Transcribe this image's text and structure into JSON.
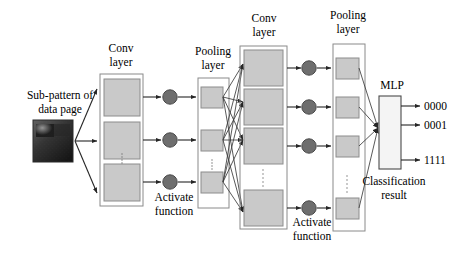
{
  "figure": {
    "kind": "cnn-architecture-diagram",
    "background": "#ffffff"
  },
  "labels": {
    "input_line1": "Sub-pattern of",
    "input_line2": "data page",
    "conv1_line1": "Conv",
    "conv1_line2": "layer",
    "pool1_line1": "Pooling",
    "pool1_line2": "layer",
    "conv2_line1": "Conv",
    "conv2_line2": "layer",
    "pool2_line1": "Pooling",
    "pool2_line2": "layer",
    "activate1_line1": "Activate",
    "activate1_line2": "function",
    "activate2_line1": "Activate",
    "activate2_line2": "function",
    "mlp": "MLP",
    "result_line1": "Classification",
    "result_line2": "result"
  },
  "outputs": [
    {
      "code": "0000"
    },
    {
      "code": "0001"
    },
    {
      "code": "1111"
    }
  ],
  "colors": {
    "feature_map_fill": "#c9c9c9",
    "feature_map_stroke": "#8c8c8c",
    "container_stroke": "#8a8a8a",
    "activation_node_fill": "#6e6e6e",
    "mlp_fill": "#f4f4f4",
    "connection_stroke": "#3b3b3b",
    "text": "#000000"
  },
  "layers": {
    "conv1": {
      "name": "Conv layer",
      "feature_maps": 3,
      "ellipsis": true
    },
    "pool1": {
      "name": "Pooling layer",
      "feature_maps": 3,
      "ellipsis": true
    },
    "conv2": {
      "name": "Conv layer",
      "feature_maps": 4,
      "ellipsis": true
    },
    "pool2": {
      "name": "Pooling layer",
      "feature_maps": 4,
      "ellipsis": true
    },
    "mlp": {
      "name": "MLP",
      "outputs": 3
    }
  },
  "thumbnail": {
    "name": "sub-pattern-data-page-image",
    "description": "dark speckled square with lighter patch upper-left"
  }
}
